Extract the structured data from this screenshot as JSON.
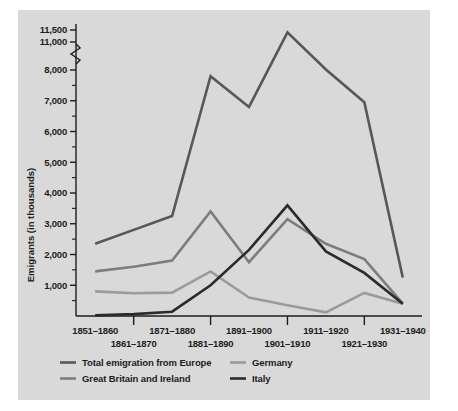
{
  "figure": {
    "background_color": "#d9d9d9",
    "page_color": "#ffffff",
    "axis_color": "#1c1c1c"
  },
  "chart_data": {
    "type": "line",
    "title": "",
    "xlabel": "",
    "ylabel": "Emigrants (in thousands)",
    "categories": [
      "1851–1860",
      "1861–1870",
      "1871–1880",
      "1881–1890",
      "1891–1900",
      "1901–1910",
      "1911–1920",
      "1921–1930",
      "1931–1940"
    ],
    "ylim": [
      0,
      11500
    ],
    "y_ticks": [
      1000,
      2000,
      3000,
      4000,
      5000,
      6000,
      7000,
      8000,
      11000,
      11500
    ],
    "y_tick_labels": [
      "1,000",
      "2,000",
      "3,000",
      "4,000",
      "5,000",
      "6,000",
      "7,000",
      "8,000",
      "11,000",
      "11,500"
    ],
    "y_minor_tick_step": 500,
    "axis_break": {
      "present": true,
      "below": 8000,
      "above": 11000,
      "symbol": "squiggle"
    },
    "grid": false,
    "legend_position": "bottom",
    "series": [
      {
        "name": "Total emigration from Europe",
        "color": "#575757",
        "width": 2.6,
        "values": [
          2350,
          2800,
          3250,
          7800,
          6800,
          11400,
          8050,
          6950,
          1250
        ]
      },
      {
        "name": "Great Britain and Ireland",
        "color": "#7d7d7d",
        "width": 2.6,
        "values": [
          1450,
          1600,
          1800,
          3400,
          1750,
          3150,
          2350,
          1850,
          400
        ]
      },
      {
        "name": "Germany",
        "color": "#9b9b9b",
        "width": 2.6,
        "values": [
          800,
          740,
          760,
          1450,
          600,
          350,
          120,
          750,
          400
        ]
      },
      {
        "name": "Italy",
        "color": "#2b2b2b",
        "width": 2.6,
        "values": [
          20,
          60,
          140,
          1000,
          2150,
          3600,
          2100,
          1400,
          400
        ]
      }
    ]
  },
  "legend": {
    "entries": [
      {
        "label": "Total emigration from Europe",
        "color": "#575757"
      },
      {
        "label": "Germany",
        "color": "#9b9b9b"
      },
      {
        "label": "Great Britain and Ireland",
        "color": "#7d7d7d"
      },
      {
        "label": "Italy",
        "color": "#2b2b2b"
      }
    ]
  }
}
